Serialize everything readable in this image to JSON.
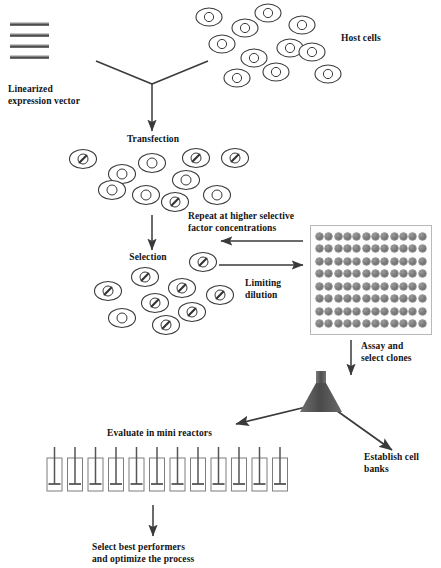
{
  "figure": {
    "title_absent": true,
    "background": "#ffffff",
    "ink": "#2b2b2b"
  },
  "labels": {
    "linearized_vector": "Linearized\nexpression vector",
    "host_cells": "Host cells",
    "transfection": "Transfection",
    "repeat_selective": "Repeat at higher selective\nfactor concentrations",
    "selection": "Selection",
    "limiting_dilution": "Limiting\ndilution",
    "assay_select_clones": "Assay and\nselect clones",
    "establish_cell_banks": "Establish cell\nbanks",
    "evaluate_mini_reactors": "Evaluate in mini reactors",
    "select_best_performers": "Select best performers\nand optimize the process"
  },
  "vector_icon": {
    "name": "linearized-expression-vector",
    "bar_count": 4,
    "bars_y": [
      22,
      33,
      44,
      55
    ],
    "x": 10
  },
  "host_cells": {
    "count": 11,
    "cells": [
      {
        "cx": 209,
        "cy": 17
      },
      {
        "cx": 245,
        "cy": 28
      },
      {
        "cx": 268,
        "cy": 13
      },
      {
        "cx": 302,
        "cy": 25
      },
      {
        "cx": 222,
        "cy": 44
      },
      {
        "cx": 254,
        "cy": 58
      },
      {
        "cx": 290,
        "cy": 48
      },
      {
        "cx": 276,
        "cy": 72
      },
      {
        "cx": 328,
        "cy": 74
      },
      {
        "cx": 237,
        "cy": 78
      },
      {
        "cx": 312,
        "cy": 52
      }
    ]
  },
  "transfected_cells": {
    "count": 10,
    "cells": [
      {
        "cx": 83,
        "cy": 159,
        "transfected": true
      },
      {
        "cx": 122,
        "cy": 174,
        "transfected": false
      },
      {
        "cx": 152,
        "cy": 163,
        "transfected": false
      },
      {
        "cx": 196,
        "cy": 158,
        "transfected": true
      },
      {
        "cx": 235,
        "cy": 158,
        "transfected": true
      },
      {
        "cx": 186,
        "cy": 180,
        "transfected": false
      },
      {
        "cx": 146,
        "cy": 195,
        "transfected": false
      },
      {
        "cx": 175,
        "cy": 202,
        "transfected": true
      },
      {
        "cx": 217,
        "cy": 195,
        "transfected": false
      },
      {
        "cx": 112,
        "cy": 190,
        "transfected": false
      }
    ]
  },
  "selected_cells": {
    "count": 9,
    "cells": [
      {
        "cx": 203,
        "cy": 262,
        "transfected": true
      },
      {
        "cx": 145,
        "cy": 277,
        "transfected": true
      },
      {
        "cx": 182,
        "cy": 288,
        "transfected": true
      },
      {
        "cx": 108,
        "cy": 291,
        "transfected": true
      },
      {
        "cx": 220,
        "cy": 295,
        "transfected": true
      },
      {
        "cx": 155,
        "cy": 303,
        "transfected": true
      },
      {
        "cx": 192,
        "cy": 312,
        "transfected": true
      },
      {
        "cx": 122,
        "cy": 318,
        "transfected": false
      },
      {
        "cx": 166,
        "cy": 325,
        "transfected": true
      }
    ]
  },
  "microplate": {
    "name": "96-well-plate",
    "rows": 8,
    "columns": 12,
    "well_count": 96,
    "x": 310,
    "y": 225,
    "width": 122,
    "height": 110
  },
  "mini_reactors": {
    "count": 12,
    "x_start": 47,
    "spacing": 20.5,
    "y": 458,
    "vessel_width": 15,
    "vessel_height": 33
  },
  "funnel": {
    "name": "funnel",
    "apex_x": 321,
    "top_y": 377,
    "base_y": 412,
    "half_width": 21
  },
  "arrows": [
    {
      "name": "vector-to-transfection-left-branch",
      "x1": 96,
      "y1": 61,
      "x2": 152,
      "y2": 84
    },
    {
      "name": "cells-to-transfection-right-branch",
      "x1": 208,
      "y1": 61,
      "x2": 152,
      "y2": 84
    },
    {
      "name": "transfection-down-arrow",
      "x1": 152,
      "y1": 84,
      "x2": 152,
      "y2": 131
    },
    {
      "name": "transfection-to-selection-arrow",
      "x1": 152,
      "y1": 215,
      "x2": 152,
      "y2": 250
    },
    {
      "name": "repeat-higher-selective-arrow",
      "x1": 303,
      "y1": 241,
      "x2": 221,
      "y2": 241
    },
    {
      "name": "limiting-dilution-arrow",
      "x1": 219,
      "y1": 265,
      "x2": 303,
      "y2": 265
    },
    {
      "name": "plate-to-funnel-arrow",
      "x1": 351,
      "y1": 340,
      "x2": 351,
      "y2": 375
    },
    {
      "name": "funnel-to-reactors-arrow",
      "x1": 335,
      "y1": 400,
      "x2": 236,
      "y2": 424
    },
    {
      "name": "funnel-to-cell-banks-arrow",
      "x1": 333,
      "y1": 408,
      "x2": 392,
      "y2": 450
    },
    {
      "name": "reactors-to-best-performers-arrow",
      "x1": 153,
      "y1": 505,
      "x2": 153,
      "y2": 536
    }
  ],
  "colors": {
    "ink": "#2b2b2b",
    "cell_outline": "#3a3a3a",
    "well_fill": "#7d7d7d",
    "funnel_fill": "#555555",
    "plate_border": "#b9b9b9"
  }
}
